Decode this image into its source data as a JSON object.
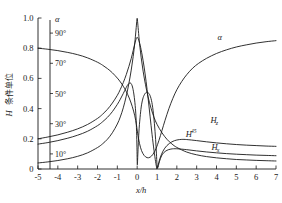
{
  "chart_data": {
    "type": "line",
    "title": "",
    "xlabel": "x/h",
    "ylabel": "H 条件单位",
    "ylabel_symbol": "H",
    "ylabel_text": "条件单位",
    "xlim": [
      -5,
      7
    ],
    "ylim": [
      0,
      1.0
    ],
    "grid": false,
    "legend": "inline-labels",
    "x_ticks": [
      "-5",
      "-4",
      "-3",
      "-2",
      "-1",
      "0",
      "1",
      "2",
      "3",
      "4",
      "5",
      "6",
      "7"
    ],
    "x_tick_values": [
      -5,
      -4,
      -3,
      -2,
      -1,
      0,
      1,
      2,
      3,
      4,
      5,
      6,
      7
    ],
    "y_ticks": [
      "0",
      "0.2",
      "0.4",
      "0.6",
      "0.8",
      "1.0"
    ],
    "y_tick_values": [
      0,
      0.2,
      0.4,
      0.6,
      0.8,
      1.0
    ],
    "secondary_axis": {
      "symbol": "α",
      "ticks": [
        "10°",
        "30°",
        "50°",
        "70°",
        "90°"
      ],
      "tick_values": [
        10,
        30,
        50,
        70,
        90
      ],
      "range": [
        0,
        100
      ],
      "unit": "degrees"
    },
    "series": [
      {
        "name": "α",
        "label": "α",
        "label_base": "α",
        "label_sub": "",
        "label_sup": "",
        "label_x": 4.05,
        "label_y": 0.855,
        "points": [
          [
            -5,
            0.8
          ],
          [
            -4.5,
            0.793
          ],
          [
            -4,
            0.784
          ],
          [
            -3.5,
            0.772
          ],
          [
            -3,
            0.757
          ],
          [
            -2.5,
            0.736
          ],
          [
            -2,
            0.707
          ],
          [
            -1.75,
            0.688
          ],
          [
            -1.5,
            0.665
          ],
          [
            -1.25,
            0.637
          ],
          [
            -1.0,
            0.602
          ],
          [
            -0.85,
            0.577
          ],
          [
            -0.7,
            0.548
          ],
          [
            -0.55,
            0.513
          ],
          [
            -0.4,
            0.47
          ],
          [
            -0.25,
            0.415
          ],
          [
            -0.12,
            0.352
          ],
          [
            -0.04,
            0.295
          ],
          [
            0,
            0.258
          ],
          [
            0.05,
            0.215
          ],
          [
            0.12,
            0.168
          ],
          [
            0.22,
            0.122
          ],
          [
            0.35,
            0.09
          ],
          [
            0.5,
            0.075
          ],
          [
            0.65,
            0.078
          ],
          [
            0.8,
            0.098
          ],
          [
            0.95,
            0.135
          ],
          [
            1.1,
            0.19
          ],
          [
            1.25,
            0.255
          ],
          [
            1.4,
            0.32
          ],
          [
            1.6,
            0.4
          ],
          [
            1.8,
            0.468
          ],
          [
            2.0,
            0.525
          ],
          [
            2.25,
            0.58
          ],
          [
            2.5,
            0.625
          ],
          [
            2.8,
            0.668
          ],
          [
            3.1,
            0.7
          ],
          [
            3.5,
            0.733
          ],
          [
            4.0,
            0.765
          ],
          [
            4.5,
            0.789
          ],
          [
            5.0,
            0.808
          ],
          [
            5.5,
            0.822
          ],
          [
            6.0,
            0.834
          ],
          [
            6.5,
            0.843
          ],
          [
            7,
            0.85
          ]
        ]
      },
      {
        "name": "H_z",
        "label": "Hz",
        "label_base": "H",
        "label_sub": "z",
        "label_sup": "",
        "label_x": 3.7,
        "label_y": 0.305,
        "points": [
          [
            -5,
            0.04
          ],
          [
            -4.5,
            0.047
          ],
          [
            -4,
            0.056
          ],
          [
            -3.5,
            0.068
          ],
          [
            -3,
            0.084
          ],
          [
            -2.5,
            0.107
          ],
          [
            -2,
            0.142
          ],
          [
            -1.75,
            0.166
          ],
          [
            -1.5,
            0.197
          ],
          [
            -1.25,
            0.24
          ],
          [
            -1.0,
            0.298
          ],
          [
            -0.85,
            0.345
          ],
          [
            -0.7,
            0.405
          ],
          [
            -0.55,
            0.483
          ],
          [
            -0.42,
            0.565
          ],
          [
            -0.3,
            0.655
          ],
          [
            -0.2,
            0.745
          ],
          [
            -0.12,
            0.835
          ],
          [
            -0.06,
            0.92
          ],
          [
            -0.02,
            0.978
          ],
          [
            0.0,
            0.998
          ],
          [
            0.02,
            0.978
          ],
          [
            0.06,
            0.918
          ],
          [
            0.12,
            0.83
          ],
          [
            0.2,
            0.74
          ],
          [
            0.3,
            0.648
          ],
          [
            0.42,
            0.558
          ],
          [
            0.55,
            0.478
          ],
          [
            0.7,
            0.402
          ],
          [
            0.85,
            0.342
          ],
          [
            1.0,
            0.296
          ],
          [
            1.25,
            0.24
          ],
          [
            1.5,
            0.197
          ],
          [
            1.75,
            0.166
          ],
          [
            2.0,
            0.143
          ],
          [
            2.5,
            0.112
          ],
          [
            3.0,
            0.094
          ],
          [
            3.5,
            0.082
          ],
          [
            4.0,
            0.074
          ],
          [
            4.5,
            0.068
          ],
          [
            5.0,
            0.063
          ],
          [
            5.5,
            0.06
          ],
          [
            6.0,
            0.057
          ],
          [
            6.5,
            0.055
          ],
          [
            7,
            0.053
          ]
        ]
      },
      {
        "name": "H_45",
        "label": "H45",
        "label_base": "H",
        "label_sub": "",
        "label_sup": "45",
        "label_x": 2.45,
        "label_y": 0.215,
        "points": [
          [
            -5,
            0.2
          ],
          [
            -4.5,
            0.212
          ],
          [
            -4,
            0.226
          ],
          [
            -3.5,
            0.244
          ],
          [
            -3,
            0.266
          ],
          [
            -2.5,
            0.295
          ],
          [
            -2,
            0.335
          ],
          [
            -1.75,
            0.362
          ],
          [
            -1.5,
            0.395
          ],
          [
            -1.25,
            0.437
          ],
          [
            -1.0,
            0.488
          ],
          [
            -0.85,
            0.527
          ],
          [
            -0.7,
            0.572
          ],
          [
            -0.55,
            0.625
          ],
          [
            -0.42,
            0.678
          ],
          [
            -0.3,
            0.732
          ],
          [
            -0.2,
            0.785
          ],
          [
            -0.12,
            0.83
          ],
          [
            -0.05,
            0.862
          ],
          [
            0.0,
            0.872
          ],
          [
            0.06,
            0.86
          ],
          [
            0.15,
            0.82
          ],
          [
            0.25,
            0.755
          ],
          [
            0.35,
            0.675
          ],
          [
            0.45,
            0.58
          ],
          [
            0.55,
            0.47
          ],
          [
            0.65,
            0.35
          ],
          [
            0.75,
            0.23
          ],
          [
            0.85,
            0.122
          ],
          [
            0.93,
            0.048
          ],
          [
            0.98,
            0.01
          ],
          [
            1.0,
            0.002
          ],
          [
            1.05,
            0.022
          ],
          [
            1.15,
            0.07
          ],
          [
            1.3,
            0.118
          ],
          [
            1.5,
            0.155
          ],
          [
            1.75,
            0.18
          ],
          [
            2.0,
            0.192
          ],
          [
            2.25,
            0.196
          ],
          [
            2.5,
            0.195
          ],
          [
            3.0,
            0.188
          ],
          [
            3.5,
            0.18
          ],
          [
            4.0,
            0.173
          ],
          [
            4.5,
            0.167
          ],
          [
            5.0,
            0.162
          ],
          [
            5.5,
            0.158
          ],
          [
            6.0,
            0.155
          ],
          [
            6.5,
            0.152
          ],
          [
            7,
            0.15
          ]
        ]
      },
      {
        "name": "H_x",
        "label": "Hx",
        "label_base": "H",
        "label_sub": "x",
        "label_sup": "",
        "label_x": 3.75,
        "label_y": 0.128,
        "points": [
          [
            -5,
            0.165
          ],
          [
            -4.5,
            0.175
          ],
          [
            -4,
            0.188
          ],
          [
            -3.5,
            0.204
          ],
          [
            -3,
            0.224
          ],
          [
            -2.5,
            0.25
          ],
          [
            -2,
            0.287
          ],
          [
            -1.75,
            0.312
          ],
          [
            -1.5,
            0.342
          ],
          [
            -1.25,
            0.38
          ],
          [
            -1.0,
            0.428
          ],
          [
            -0.85,
            0.462
          ],
          [
            -0.7,
            0.5
          ],
          [
            -0.55,
            0.54
          ],
          [
            -0.45,
            0.562
          ],
          [
            -0.35,
            0.57
          ],
          [
            -0.28,
            0.56
          ],
          [
            -0.22,
            0.535
          ],
          [
            -0.16,
            0.49
          ],
          [
            -0.1,
            0.42
          ],
          [
            -0.06,
            0.345
          ],
          [
            -0.03,
            0.25
          ],
          [
            -0.01,
            0.14
          ],
          [
            0.0,
            0.06
          ],
          [
            0.01,
            0.028
          ],
          [
            0.03,
            0.085
          ],
          [
            0.06,
            0.175
          ],
          [
            0.1,
            0.27
          ],
          [
            0.16,
            0.36
          ],
          [
            0.22,
            0.425
          ],
          [
            0.3,
            0.472
          ],
          [
            0.4,
            0.5
          ],
          [
            0.5,
            0.508
          ],
          [
            0.62,
            0.495
          ],
          [
            0.72,
            0.455
          ],
          [
            0.8,
            0.39
          ],
          [
            0.87,
            0.3
          ],
          [
            0.93,
            0.195
          ],
          [
            0.97,
            0.105
          ],
          [
            1.0,
            0.03
          ],
          [
            1.04,
            0.008
          ],
          [
            1.12,
            0.048
          ],
          [
            1.25,
            0.093
          ],
          [
            1.45,
            0.12
          ],
          [
            1.7,
            0.132
          ],
          [
            2.0,
            0.134
          ],
          [
            2.5,
            0.128
          ],
          [
            3.0,
            0.12
          ],
          [
            3.5,
            0.113
          ],
          [
            4.0,
            0.107
          ],
          [
            4.5,
            0.102
          ],
          [
            5.0,
            0.098
          ],
          [
            5.5,
            0.095
          ],
          [
            6.0,
            0.092
          ],
          [
            6.5,
            0.09
          ],
          [
            7,
            0.088
          ]
        ]
      }
    ]
  }
}
